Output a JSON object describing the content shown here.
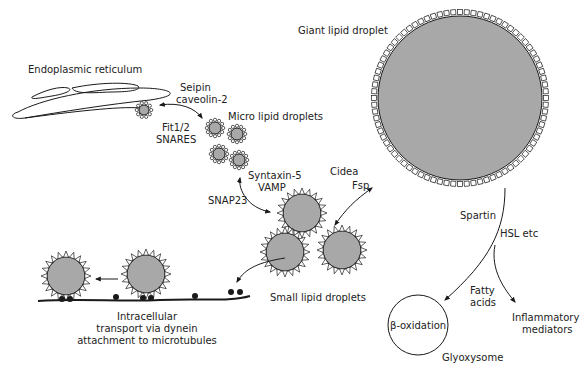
{
  "colors": {
    "droplet_fill": "#a8a8a8",
    "outline": "#1a1a1a",
    "background": "#ffffff",
    "text": "#222222"
  },
  "labels": {
    "er": "Endoplasmic reticulum",
    "seipin": "Seipin",
    "caveolin": "caveolin-2",
    "fit": "Fit1/2",
    "snares": "SNARES",
    "micro": "Micro lipid droplets",
    "syntaxin": "Syntaxin-5",
    "vamp": "VAMP",
    "snap23": "SNAP23",
    "cidea": "Cidea",
    "fsp": "Fsp",
    "small": "Small lipid droplets",
    "giant": "Giant lipid droplet",
    "spartin": "Spartin",
    "hsl": "HSL etc",
    "fatty1": "Fatty",
    "fatty2": "acids",
    "inflam1": "Inflammatory",
    "inflam2": "mediators",
    "beta": "β-oxidation",
    "glyox": "Glyoxysome",
    "transport1": "Intracellular",
    "transport2": "transport via dynein",
    "transport3": "attachment to microtubules"
  }
}
